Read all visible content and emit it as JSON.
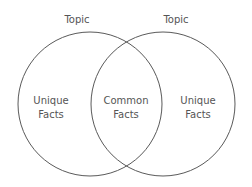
{
  "diagram": {
    "type": "venn",
    "left_circle": {
      "topic": "Topic",
      "label_line1": "Unique",
      "label_line2": "Facts"
    },
    "right_circle": {
      "topic": "Topic",
      "label_line1": "Unique",
      "label_line2": "Facts"
    },
    "overlap": {
      "label_line1": "Common",
      "label_line2": "Facts"
    },
    "stroke_color": "#555555"
  }
}
